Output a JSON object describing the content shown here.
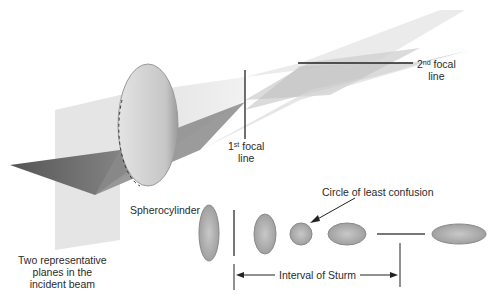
{
  "diagram": {
    "labels": {
      "spherocylinder": "Spherocylinder",
      "first_focal_line": {
        "ordinal": "1",
        "sup": "st",
        "line1": "focal",
        "line2": "line"
      },
      "second_focal_line": {
        "ordinal": "2",
        "sup": "nd",
        "line1": "focal",
        "line2": "line"
      },
      "circle_of_least_confusion": "Circle of least confusion",
      "interval_of_sturm": "Interval of Sturm",
      "planes": [
        "Two representative",
        "planes in the",
        "incident beam"
      ]
    },
    "cross_sections": [
      "vertical-ellipse-large",
      "vertical-line",
      "vertical-ellipse-small",
      "circle",
      "horizontal-ellipse-small",
      "horizontal-line",
      "horizontal-ellipse-large"
    ],
    "colors": {
      "ellipse_fill": "#b4b4b4",
      "ellipse_stroke": "#8a8a8a",
      "beam_dark": "#6e6e6e",
      "beam_light": "#dcdcdc",
      "lens": "#c8c8c8",
      "line": "#333333"
    }
  }
}
